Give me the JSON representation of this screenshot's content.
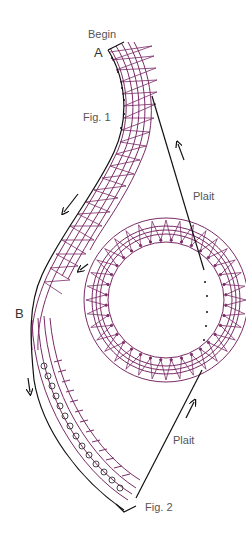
{
  "diagram": {
    "type": "bobbin-lace-pattern",
    "labels": {
      "begin": "Begin",
      "point_a": "A",
      "fig1": "Fig. 1",
      "plait_top": "Plait",
      "point_b": "B",
      "plait_bottom": "Plait",
      "fig2": "Fig. 2"
    },
    "colors": {
      "thread": "#7a2a66",
      "outline": "#111111",
      "label": "#555555",
      "background": "#ffffff"
    }
  }
}
